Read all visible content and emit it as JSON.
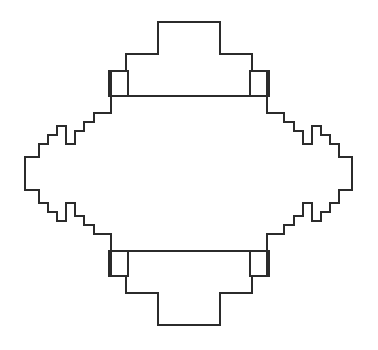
{
  "figure": {
    "title": "Quadratic staircase closed curve",
    "background_color": "#ffffff",
    "stroke_color": "#2b2b2b",
    "stroke_width": 2,
    "canvas": {
      "width": 378,
      "height": 350
    },
    "center": {
      "x": 188,
      "y": 172
    },
    "extents": {
      "left_x": 25,
      "right_x": 352,
      "top_y": 22,
      "bottom_y": 325
    },
    "apex_plateaus": {
      "top": {
        "x1": 158,
        "x2": 220,
        "y": 22
      },
      "bottom": {
        "x1": 158,
        "x2": 220,
        "y": 325
      },
      "left": {
        "y1": 157,
        "y2": 190,
        "x": 25
      },
      "right": {
        "y1": 157,
        "y2": 190,
        "x": 352
      }
    },
    "large_squares": [
      {
        "name": "top-left-square",
        "x": 111,
        "y": 96,
        "size": 17
      },
      {
        "name": "top-right-square",
        "x": 249,
        "y": 96,
        "size": 17
      },
      {
        "name": "bottom-left-square",
        "x": 111,
        "y": 237,
        "size": 17
      },
      {
        "name": "bottom-right-square",
        "x": 249,
        "y": 237,
        "size": 17
      }
    ],
    "small_squares": [
      {
        "name": "upper-left-small-square",
        "x": 66,
        "y": 135,
        "size": 9
      },
      {
        "name": "upper-right-small-square",
        "x": 302,
        "y": 135,
        "size": 9
      },
      {
        "name": "lower-left-small-square",
        "x": 66,
        "y": 205,
        "size": 9
      },
      {
        "name": "lower-right-small-square",
        "x": 302,
        "y": 205,
        "size": 9
      }
    ],
    "outline_path": "M 158 22 L 220 22 L 220 54 L 252 54 L 252 71 L 269 71 L 269 96 L 128 96 L 128 71 L 111 71 L 111 113 L 94 113 L 94 122 L 84 122 L 84 131 L 75 131 L 75 144 L 66 144 L 66 126 L 57 126 L 57 135 L 48 135 L 48 144 L 39 144 L 39 157 L 25 157 L 25 190 L 39 190 L 39 203 L 48 203 L 48 212 L 57 212 L 57 221 L 66 221 L 66 203 L 75 203 L 75 216 L 84 216 L 84 225 L 94 225 L 94 234 L 111 234 L 111 276 L 128 276 L 128 251 L 269 251 L 269 276 L 252 276 L 252 293 L 220 293 L 220 325 L 158 325 L 158 293 L 126 293 L 126 276 L 109 276 L 109 251 L 250 251 L 250 276 L 267 276 L 267 234 L 284 234 L 284 225 L 294 225 L 294 216 L 303 216 L 303 203 L 312 203 L 312 221 L 321 221 L 321 212 L 330 212 L 330 203 L 339 203 L 339 190 L 352 190 L 352 157 L 339 157 L 339 144 L 330 144 L 330 135 L 321 135 L 321 126 L 312 126 L 312 144 L 303 144 L 303 131 L 294 131 L 294 122 L 284 122 L 284 113 L 267 113 L 267 71 L 250 71 L 250 96 L 109 96 L 109 71 L 126 71 L 126 54 L 158 54 Z"
  }
}
